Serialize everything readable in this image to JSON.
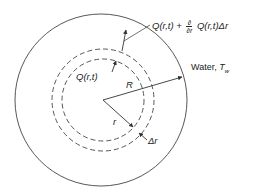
{
  "diagram": {
    "type": "cylindrical heat balance cross-section",
    "labels": {
      "flux_out_main": "Q(r,t) + ",
      "flux_out_num": "∂",
      "flux_out_den": "∂r",
      "flux_out_tail": " Q(r,t)Δr",
      "flux_in": "Q(r,t)",
      "water": "Water, ",
      "water_temp": "T",
      "water_temp_sub": "w",
      "outer_radius": "R",
      "inner_radius": "r",
      "shell_thickness": "Δr"
    },
    "colors": {
      "line": "#333333",
      "background": "#ffffff"
    },
    "geometry": {
      "outer_circle": {
        "cx": 101,
        "cy": 100,
        "r": 86
      },
      "dashed_inner": {
        "cx": 103,
        "cy": 100,
        "r": 41
      },
      "dashed_outer": {
        "cx": 103,
        "cy": 100,
        "r": 51
      }
    }
  }
}
